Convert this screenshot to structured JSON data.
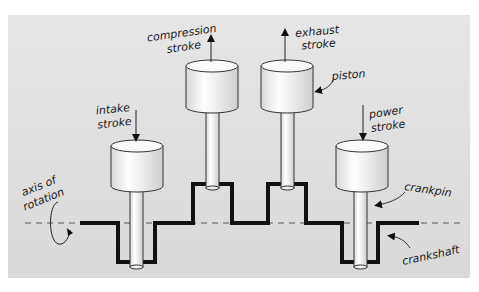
{
  "diagram": {
    "labels": {
      "intake": [
        "intake",
        "stroke"
      ],
      "compression": [
        "compression",
        "stroke"
      ],
      "exhaust": [
        "exhaust",
        "stroke"
      ],
      "power": [
        "power",
        "stroke"
      ],
      "piston": "piston",
      "crankpin": "crankpin",
      "crankshaft": "crankshaft",
      "axis": [
        "axis of",
        "rotation"
      ]
    },
    "pistons": [
      {
        "name": "intake",
        "direction": "down",
        "position": "low"
      },
      {
        "name": "compression",
        "direction": "up",
        "position": "high"
      },
      {
        "name": "exhaust",
        "direction": "up",
        "position": "high"
      },
      {
        "name": "power",
        "direction": "down",
        "position": "low"
      }
    ],
    "colors": {
      "background": "#dedede",
      "crankshaft": "#111111",
      "piston_fill": "#f2f2f2",
      "outline": "#333333"
    }
  }
}
